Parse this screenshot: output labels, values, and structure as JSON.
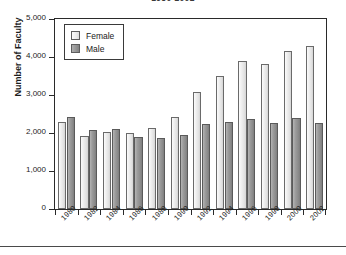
{
  "chart_data": {
    "type": "bar",
    "title": "1980-2002",
    "xlabel": "",
    "ylabel": "Number of Faculty",
    "ylim": [
      0,
      5000
    ],
    "yticks": [
      0,
      1000,
      2000,
      3000,
      4000,
      5000
    ],
    "ytick_labels": [
      "0",
      "1,000",
      "2,000",
      "3,000",
      "4,000",
      "5,000"
    ],
    "grid": false,
    "legend_position": "upper left inside",
    "categories": [
      "1980",
      "1982",
      "1984",
      "1986",
      "1988",
      "1990",
      "1992",
      "1994",
      "1996",
      "1998",
      "2000",
      "2002"
    ],
    "series": [
      {
        "name": "Female",
        "color": "#ececec",
        "values": [
          2290,
          1920,
          2020,
          2010,
          2140,
          2430,
          3080,
          3490,
          3900,
          3810,
          4170,
          4280
        ]
      },
      {
        "name": "Male",
        "color": "#919191",
        "values": [
          2420,
          2090,
          2100,
          1890,
          1870,
          1950,
          2230,
          2290,
          2380,
          2270,
          2390,
          2260
        ]
      }
    ]
  },
  "legend": {
    "items": [
      {
        "label": "Female",
        "series": "female"
      },
      {
        "label": "Male",
        "series": "male"
      }
    ]
  }
}
